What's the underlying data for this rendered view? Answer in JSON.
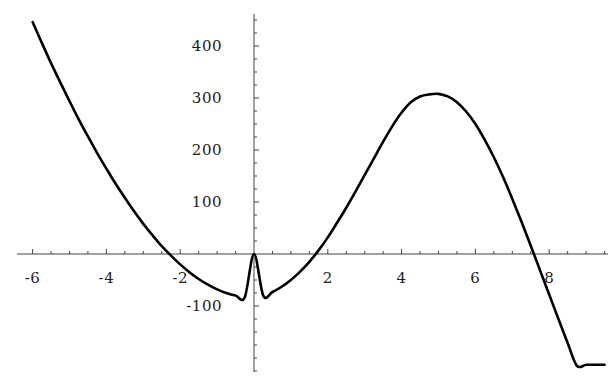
{
  "chart_data": {
    "type": "line",
    "title": "",
    "subtitle": "",
    "xlabel": "",
    "ylabel": "",
    "xlim": [
      -6.6,
      9.7
    ],
    "ylim": [
      -240,
      470
    ],
    "grid": false,
    "legend": null,
    "axis_style": "centered-cross",
    "x_ticks_major": [
      -6,
      -4,
      -2,
      2,
      4,
      6,
      8
    ],
    "x_tick_labels": [
      "-6",
      "-4",
      "-2",
      "2",
      "4",
      "6",
      "8"
    ],
    "x_ticks_minor_step": 0.5,
    "y_ticks_major": [
      400,
      300,
      200,
      100,
      -100
    ],
    "y_tick_labels": [
      "400",
      "300",
      "200",
      "100",
      "-100"
    ],
    "y_ticks_minor_step": 25,
    "curve_color": "#000000",
    "axis_color": "#444444",
    "roots": [
      -3.44,
      0,
      8.13
    ],
    "local_minimum": {
      "x": -1.9,
      "y": -73
    },
    "local_maximum": {
      "x": 5.0,
      "y": 288
    },
    "series": [
      {
        "name": "cubic",
        "x": [
          -6.0,
          -5.75,
          -5.5,
          -5.25,
          -5.0,
          -4.75,
          -4.5,
          -4.25,
          -4.0,
          -3.75,
          -3.5,
          -3.25,
          -3.0,
          -2.75,
          -2.5,
          -2.25,
          -2.0,
          -1.75,
          -1.5,
          -1.25,
          -1.0,
          -0.75,
          -0.5,
          -0.25,
          0.0,
          0.25,
          0.5,
          0.75,
          1.0,
          1.25,
          1.5,
          1.75,
          2.0,
          2.25,
          2.5,
          2.75,
          3.0,
          3.25,
          3.5,
          3.75,
          4.0,
          4.25,
          4.5,
          4.75,
          5.0,
          5.25,
          5.5,
          5.75,
          6.0,
          6.25,
          6.5,
          6.75,
          7.0,
          7.25,
          7.5,
          7.75,
          8.0,
          8.25,
          8.5,
          8.75,
          9.0,
          9.25,
          9.5
        ],
        "y": [
          446,
          406,
          367,
          330,
          294,
          259,
          226,
          194,
          164,
          135,
          108,
          82,
          58,
          36,
          15,
          -3,
          -20,
          -35,
          -48,
          -59,
          -68,
          -75,
          -80,
          -83,
          0,
          -80,
          -73,
          -63,
          -50,
          -34,
          -15,
          7,
          32,
          60,
          89,
          120,
          152,
          184,
          216,
          246,
          272,
          292,
          303,
          307,
          308,
          303,
          292,
          274,
          250,
          220,
          186,
          148,
          106,
          62,
          16,
          -31,
          -78,
          -125,
          -171,
          -215,
          -213,
          -213,
          -213
        ]
      }
    ]
  },
  "axes": {
    "x_axis_name": "horizontal-axis",
    "y_axis_name": "vertical-axis"
  }
}
